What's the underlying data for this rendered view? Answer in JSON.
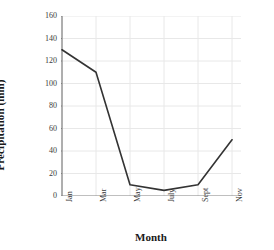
{
  "chart_data": {
    "type": "line",
    "title": "",
    "xlabel": "Month",
    "ylabel": "Precipitation (mm)",
    "categories": [
      "Jan",
      "Mar",
      "May",
      "July",
      "Sept",
      "Nov"
    ],
    "values": [
      130,
      110,
      10,
      5,
      10,
      50
    ],
    "series": [
      {
        "name": "Precipitation",
        "values": [
          130,
          110,
          10,
          5,
          10,
          50
        ]
      }
    ],
    "ylim": [
      0,
      160
    ],
    "yticks": [
      0,
      20,
      40,
      60,
      80,
      100,
      120,
      140,
      160
    ],
    "ytick_labels": [
      "0",
      "20",
      "40",
      "60",
      "80",
      "100",
      "120",
      "140",
      "160"
    ],
    "xtick_labels": [
      "Jan",
      "Mar",
      "May",
      "July",
      "Sept",
      "Nov"
    ],
    "grid": true,
    "legend": "none",
    "line_color": "#333333",
    "grid_color": "#e8e8e8",
    "axis_color": "#808080",
    "background_color": "#ffffff"
  }
}
